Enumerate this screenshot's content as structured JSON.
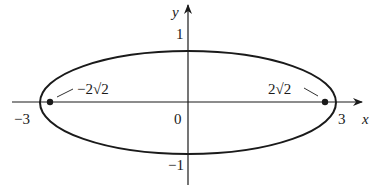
{
  "diagram": {
    "type": "ellipse",
    "equation_params": {
      "a": 3,
      "b": 1,
      "foci": [
        "-2√2",
        "2√2"
      ]
    },
    "axes": {
      "x_label": "x",
      "y_label": "y"
    },
    "ticks": {
      "x_neg": "−3",
      "x_pos": "3",
      "origin": "0",
      "y_pos": "1",
      "y_neg": "−1"
    },
    "foci_labels": {
      "left": "−2√2",
      "right": "2√2"
    },
    "colors": {
      "stroke": "#1a1a1a",
      "background": "#ffffff"
    }
  }
}
